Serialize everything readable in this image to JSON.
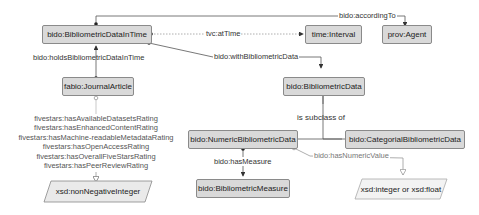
{
  "nodes": {
    "bibliometric_data_in_time": "bido:BibliometricDataInTime",
    "time_interval": "time:Interval",
    "prov_agent": "prov:Agent",
    "journal_article": "fabio:JournalArticle",
    "bibliometric_data": "bido:BibliometricData",
    "numeric_bibliometric_data": "bido:NumericBibliometricData",
    "categorial_bibliometric_data": "bido:CategorialBibliometricData",
    "bibliometric_measure": "bido:BibliometricMeasure",
    "non_negative_integer": "xsd:nonNegativeInteger",
    "integer_or_float": "xsd:integer or xsd:float"
  },
  "edges": {
    "according_to": "bido:accordingTo",
    "at_time": "tvc:atTime",
    "with_bibliometric_data": "bido:withBibliometricData",
    "holds_bibliometric_data_in_time": "bido:holdsBibliometricDataInTime",
    "is_subclass_of": "is subclass of",
    "has_measure": "bido:hasMeasure",
    "has_numeric_value": "bido:hasNumericValue"
  },
  "ratings": [
    "fivestars:hasAvailableDatasetsRating",
    "fivestars:hasEnhancedContentRating",
    "fivestars:hasMachine-readableMetadataRating",
    "fivestars:hasOpenAccessRating",
    "fivestars:hasOverallFiveStarsRating",
    "fivestars:hasPeerReviewRating"
  ]
}
